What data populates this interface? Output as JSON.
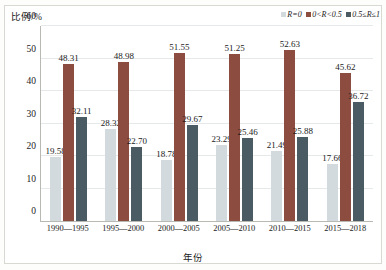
{
  "chart_data": {
    "type": "bar",
    "title": "",
    "xlabel": "年份",
    "ylabel": "比例/%",
    "ylim": [
      0,
      60
    ],
    "ytick_step": 10,
    "yticks": [
      "60",
      "50",
      "40",
      "30",
      "20",
      "10",
      "0"
    ],
    "grid": true,
    "legend_position": "top-right",
    "categories": [
      "1990—1995",
      "1995—2000",
      "2000—2005",
      "2005—2010",
      "2010—2015",
      "2015—2018"
    ],
    "series": [
      {
        "name": "R=0",
        "color": "#d3dadd",
        "values": [
          19.58,
          28.32,
          18.78,
          23.29,
          21.49,
          17.66
        ]
      },
      {
        "name": "0<R<0.5",
        "color": "#8d4c40",
        "values": [
          48.31,
          48.98,
          51.55,
          51.25,
          52.63,
          45.62
        ]
      },
      {
        "name": "0.5≤R≤1",
        "color": "#4b5b64",
        "values": [
          32.11,
          22.7,
          29.67,
          25.46,
          25.88,
          36.72
        ]
      }
    ]
  }
}
